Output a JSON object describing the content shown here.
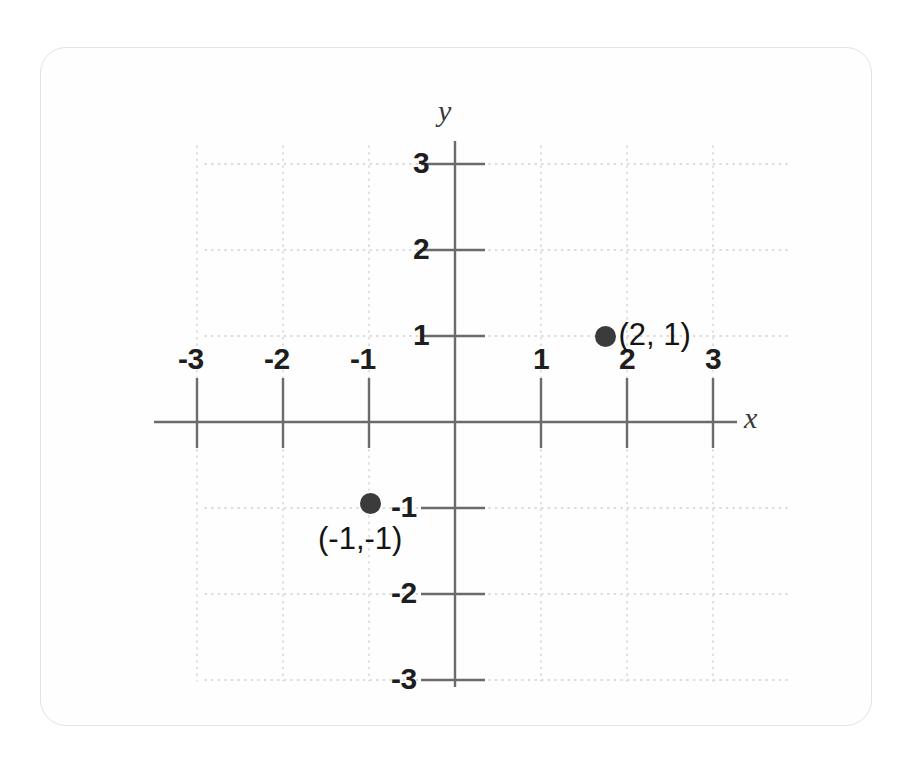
{
  "figure": {
    "kind": "cartesian-coordinate-plane",
    "background_color": "#ffffff",
    "frame_border_color": "#e3e3e3"
  },
  "chart_data": {
    "type": "scatter",
    "title": "",
    "xlabel": "x",
    "ylabel": "y",
    "xlim": [
      -3.5,
      3.5
    ],
    "ylim": [
      -3.5,
      3.5
    ],
    "grid": true,
    "grid_style": "dotted",
    "grid_color": "#cfcfcf",
    "axis_color": "#6b6b6b",
    "legend": "none",
    "x_ticks": [
      -3,
      -2,
      -1,
      1,
      2,
      3
    ],
    "y_ticks": [
      3,
      2,
      1,
      -1,
      -2,
      -3
    ],
    "x_tick_labels": [
      "-3",
      "-2",
      "-1",
      "1",
      "2",
      "3"
    ],
    "y_tick_labels": [
      "3",
      "2",
      "1",
      "-1",
      "-2",
      "-3"
    ],
    "points": [
      {
        "x": 2,
        "y": 1,
        "label": "(2, 1)",
        "color": "#3b3b3b"
      },
      {
        "x": -1,
        "y": -1,
        "label": "(-1,-1)",
        "color": "#3b3b3b"
      }
    ]
  },
  "axis_labels": {
    "x": "x",
    "y": "y"
  },
  "x_axis_ticks": [
    {
      "value": -3,
      "label": "-3"
    },
    {
      "value": -2,
      "label": "-2"
    },
    {
      "value": -1,
      "label": "-1"
    },
    {
      "value": 1,
      "label": "1"
    },
    {
      "value": 2,
      "label": "2"
    },
    {
      "value": 3,
      "label": "3"
    }
  ],
  "y_axis_ticks": [
    {
      "value": 3,
      "label": "3"
    },
    {
      "value": 2,
      "label": "2"
    },
    {
      "value": 1,
      "label": "1"
    },
    {
      "value": -1,
      "label": "-1"
    },
    {
      "value": -2,
      "label": "-2"
    },
    {
      "value": -3,
      "label": "-3"
    }
  ],
  "plotted_points": [
    {
      "label": "(2, 1)",
      "x": 2,
      "y": 1
    },
    {
      "label": "(-1,-1)",
      "x": -1,
      "y": -1
    }
  ]
}
